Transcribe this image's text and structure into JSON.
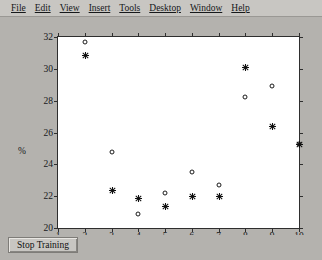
{
  "window": {
    "title": "Figure",
    "background_color": "#b4b2ae"
  },
  "menubar": {
    "items": [
      {
        "label": "File",
        "mnemonic": "F"
      },
      {
        "label": "Edit",
        "mnemonic": "E"
      },
      {
        "label": "View",
        "mnemonic": "V"
      },
      {
        "label": "Insert",
        "mnemonic": "I"
      },
      {
        "label": "Tools",
        "mnemonic": "T"
      },
      {
        "label": "Desktop",
        "mnemonic": "D"
      },
      {
        "label": "Window",
        "mnemonic": "W"
      },
      {
        "label": "Help",
        "mnemonic": "H"
      }
    ]
  },
  "toolbar": {
    "stop_training_label": "Stop Training"
  },
  "chart_data": {
    "type": "scatter",
    "title": "",
    "xlabel": "样本/组",
    "ylabel": "%",
    "xlim": [
      1,
      10
    ],
    "ylim": [
      20,
      32
    ],
    "xticks": [
      1,
      2,
      3,
      4,
      5,
      6,
      7,
      8,
      9,
      10
    ],
    "xticklabels": [
      "1",
      "2",
      "3",
      "4",
      "5",
      "6",
      "7",
      "8",
      "9",
      "10"
    ],
    "yticks": [
      20,
      22,
      24,
      26,
      28,
      30,
      32
    ],
    "yticklabels": [
      "20",
      "22",
      "24",
      "26",
      "28",
      "30",
      "32"
    ],
    "grid": false,
    "legend": "none",
    "box": true,
    "marker_color": "#101010",
    "series": [
      {
        "name": "circle-series",
        "marker": "o",
        "fill": "none",
        "x": [
          2,
          3,
          4,
          5,
          6,
          7,
          8,
          9,
          10
        ],
        "y": [
          31.7,
          24.8,
          20.9,
          22.2,
          23.5,
          22.7,
          28.2,
          28.9,
          25.3
        ]
      },
      {
        "name": "star-series",
        "marker": "*",
        "fill": "filled",
        "x": [
          2,
          3,
          4,
          5,
          6,
          7,
          8,
          9,
          10
        ],
        "y": [
          30.9,
          22.4,
          21.9,
          21.4,
          22.0,
          22.0,
          30.1,
          26.4,
          25.3
        ]
      }
    ]
  }
}
